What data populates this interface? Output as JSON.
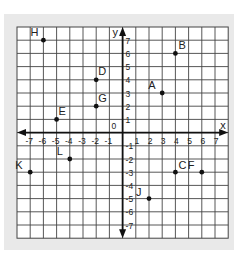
{
  "chart_data": {
    "type": "scatter",
    "title": "",
    "xlabel": "x",
    "ylabel": "y",
    "xlim": [
      -8,
      8
    ],
    "ylim": [
      -8,
      8
    ],
    "grid": true,
    "x_ticks": [
      -7,
      -6,
      -5,
      -4,
      -3,
      -2,
      -1,
      1,
      2,
      3,
      4,
      5,
      6,
      7
    ],
    "y_ticks": [
      7,
      6,
      5,
      4,
      3,
      2,
      1,
      -1,
      -2,
      -3,
      -4,
      -5,
      -6,
      -7
    ],
    "origin_label": "0",
    "points": [
      {
        "label": "A",
        "x": 3,
        "y": 3
      },
      {
        "label": "B",
        "x": 4,
        "y": 6
      },
      {
        "label": "C",
        "x": 4,
        "y": -3
      },
      {
        "label": "D",
        "x": -2,
        "y": 4
      },
      {
        "label": "E",
        "x": -5,
        "y": 1
      },
      {
        "label": "F",
        "x": 6,
        "y": -3
      },
      {
        "label": "G",
        "x": -2,
        "y": 2
      },
      {
        "label": "H",
        "x": -6,
        "y": 7
      },
      {
        "label": "J",
        "x": 2,
        "y": -5
      },
      {
        "label": "K",
        "x": -7,
        "y": -3
      },
      {
        "label": "L",
        "x": -4,
        "y": -2
      }
    ]
  },
  "colors": {
    "panel": "#e9e9e9",
    "grid_bg": "#ffffff",
    "grid_line": "#444444",
    "axis": "#111111",
    "point": "#111111",
    "text": "#222222"
  },
  "label_offsets": {
    "A": [
      -14,
      -4
    ],
    "B": [
      3,
      -4
    ],
    "C": [
      3,
      -3
    ],
    "D": [
      2,
      -5
    ],
    "E": [
      2,
      -4
    ],
    "F": [
      -14,
      -3
    ],
    "G": [
      2,
      -4
    ],
    "H": [
      -13,
      -4
    ],
    "J": [
      -13,
      -3
    ],
    "K": [
      -15,
      -3
    ],
    "L": [
      -13,
      -4
    ]
  }
}
